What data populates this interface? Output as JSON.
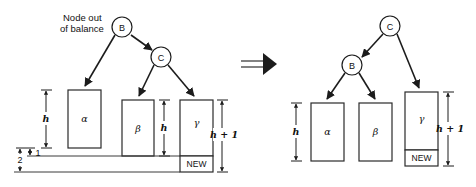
{
  "figure": {
    "annotation": {
      "node_out_of_balance_line1": "Node out",
      "node_out_of_balance_line2": "of balance"
    },
    "implication_symbol": "double-right-arrow"
  },
  "left_tree": {
    "nodes": [
      {
        "id": "B",
        "label": "B",
        "cx": 122,
        "cy": 27,
        "r": 10
      },
      {
        "id": "C",
        "label": "C",
        "cx": 161,
        "cy": 57,
        "r": 10
      }
    ],
    "subtrees": [
      {
        "id": "alpha",
        "label": "α",
        "x": 68,
        "y": 90,
        "w": 33,
        "h": 58
      },
      {
        "id": "beta",
        "label": "β",
        "x": 122,
        "y": 100,
        "w": 32,
        "h": 56
      },
      {
        "id": "gamma",
        "label": "γ",
        "x": 180,
        "y": 100,
        "w": 33,
        "h": 56
      }
    ],
    "new_box": {
      "label": "NEW",
      "x": 180,
      "y": 156,
      "w": 33,
      "h": 16
    },
    "dimensions": [
      {
        "id": "alpha-height",
        "label": "h",
        "value": "h"
      },
      {
        "id": "beta-height",
        "label": "h",
        "value": "h"
      },
      {
        "id": "gamma-height",
        "label": "h + 1",
        "value": "h + 1"
      },
      {
        "id": "offset-one",
        "label": "1",
        "value": "1"
      },
      {
        "id": "offset-two",
        "label": "2",
        "value": "2"
      }
    ]
  },
  "right_tree": {
    "nodes": [
      {
        "id": "C",
        "label": "C",
        "cx": 390,
        "cy": 26,
        "r": 10
      },
      {
        "id": "B",
        "label": "B",
        "cx": 352,
        "cy": 65,
        "r": 10
      }
    ],
    "subtrees": [
      {
        "id": "alpha",
        "label": "α",
        "x": 311,
        "y": 103,
        "w": 33,
        "h": 58
      },
      {
        "id": "beta",
        "label": "β",
        "x": 359,
        "y": 103,
        "w": 33,
        "h": 58
      },
      {
        "id": "gamma",
        "label": "γ",
        "x": 405,
        "y": 92,
        "w": 33,
        "h": 58
      }
    ],
    "new_box": {
      "label": "NEW",
      "x": 405,
      "y": 150,
      "w": 33,
      "h": 16
    },
    "dimensions": [
      {
        "id": "alpha-height",
        "label": "h",
        "value": "h"
      },
      {
        "id": "gamma-height",
        "label": "h + 1",
        "value": "h + 1"
      }
    ]
  }
}
